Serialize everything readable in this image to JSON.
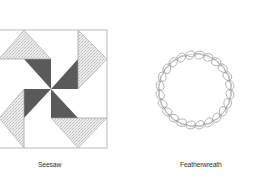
{
  "figures": [
    {
      "id": "seesaw",
      "caption": "Seesaw",
      "description": "Quilt block with four dark pinwheel triangles around center and four stippled corner triangles",
      "colors": {
        "dark": "#5a5a5a",
        "stipple": "#dcdcdc",
        "outline": "#999999"
      }
    },
    {
      "id": "featherwreath",
      "caption": "Featherwreath",
      "description": "Circular wreath of outlined feather/leaf shapes",
      "colors": {
        "outline": "#888888"
      }
    }
  ]
}
